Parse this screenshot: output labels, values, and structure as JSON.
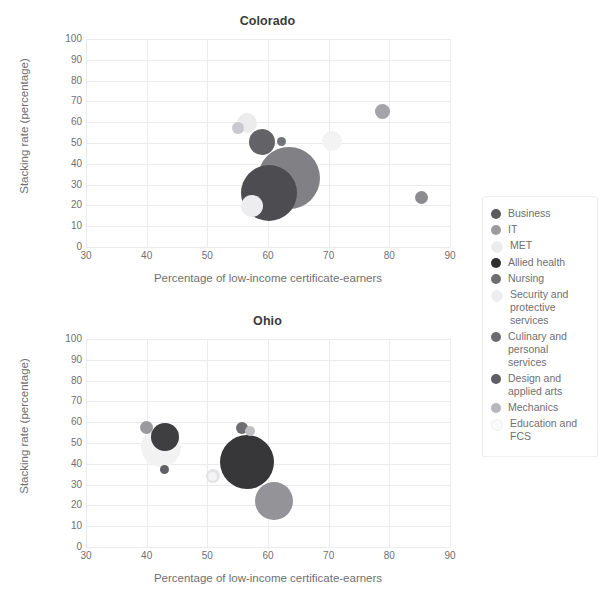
{
  "chart_data": [
    {
      "type": "scatter",
      "title": "Colorado",
      "xlabel": "Percentage of low-income certificate-earners",
      "ylabel": "Stacking rate (percentage)",
      "xlim": [
        30,
        90
      ],
      "ylim": [
        0,
        100
      ],
      "xticks": [
        30,
        40,
        50,
        60,
        70,
        80,
        90
      ],
      "yticks": [
        0,
        10,
        20,
        30,
        40,
        50,
        60,
        70,
        80,
        90,
        100
      ],
      "grid": true,
      "legend_position": "right",
      "points": [
        {
          "series": "Business",
          "x": 63.5,
          "y": 33.0,
          "size": 62,
          "color": "#808085"
        },
        {
          "series": "IT",
          "x": 85.3,
          "y": 24.0,
          "size": 13,
          "color": "#8b8b90"
        },
        {
          "series": "MET",
          "x": 56.5,
          "y": 59.5,
          "size": 20,
          "color": "#ececed"
        },
        {
          "series": "Allied health",
          "x": 60.2,
          "y": 26.0,
          "size": 56,
          "color": "#4d4d51"
        },
        {
          "series": "Nursing",
          "x": 59.0,
          "y": 50.5,
          "size": 26,
          "color": "#636367"
        },
        {
          "series": "Security and protective services",
          "x": 70.5,
          "y": 51.0,
          "size": 20,
          "color": "#f3f3f4"
        },
        {
          "series": "Culinary and personal services",
          "x": 78.8,
          "y": 65.0,
          "size": 15,
          "color": "#a4a4a8"
        },
        {
          "series": "Design and applied arts",
          "x": 62.3,
          "y": 50.5,
          "size": 9,
          "color": "#72727a"
        },
        {
          "series": "Mechanics",
          "x": 55.0,
          "y": 57.0,
          "size": 12,
          "color": "#c9c9cd"
        },
        {
          "series": "Education and FCS",
          "x": 57.3,
          "y": 19.5,
          "size": 22,
          "color": "#ededef"
        }
      ]
    },
    {
      "type": "scatter",
      "title": "Ohio",
      "xlabel": "Percentage of low-income certificate-earners",
      "ylabel": "Stacking rate (percentage)",
      "xlim": [
        30,
        90
      ],
      "ylim": [
        0,
        100
      ],
      "xticks": [
        30,
        40,
        50,
        60,
        70,
        80,
        90
      ],
      "yticks": [
        0,
        10,
        20,
        30,
        40,
        50,
        60,
        70,
        80,
        90,
        100
      ],
      "grid": true,
      "legend_position": "right",
      "points": [
        {
          "series": "Business",
          "x": 56.5,
          "y": 41.0,
          "size": 54,
          "color": "#373739"
        },
        {
          "series": "IT",
          "x": 61.0,
          "y": 22.0,
          "size": 38,
          "color": "#939398"
        },
        {
          "series": "MET",
          "x": 42.3,
          "y": 48.0,
          "size": 40,
          "color": "#f2f2f3"
        },
        {
          "series": "Allied health",
          "x": 43.0,
          "y": 53.0,
          "size": 28,
          "color": "#3f3f42"
        },
        {
          "series": "Nursing",
          "x": 55.7,
          "y": 57.0,
          "size": 12,
          "color": "#6d6d72"
        },
        {
          "series": "Security and protective services",
          "x": 51.0,
          "y": 34.0,
          "size": 14,
          "color": "#e4e4e6"
        },
        {
          "series": "Culinary and personal services",
          "x": 43.0,
          "y": 37.5,
          "size": 9,
          "color": "#616165"
        },
        {
          "series": "Design and applied arts",
          "x": 40.0,
          "y": 57.5,
          "size": 13,
          "color": "#9a9a9e"
        },
        {
          "series": "Mechanics",
          "x": 57.0,
          "y": 56.0,
          "size": 10,
          "color": "#c0c0c4"
        },
        {
          "series": "Education and FCS",
          "x": 50.8,
          "y": 33.8,
          "size": 9,
          "color": "#f4f4f5"
        }
      ]
    }
  ],
  "legend": {
    "items": [
      {
        "label": "Business",
        "color": "#5b5b60"
      },
      {
        "label": "IT",
        "color": "#9a9a9f"
      },
      {
        "label": "MET",
        "color": "#ececee"
      },
      {
        "label": "Allied health",
        "color": "#2f2f32"
      },
      {
        "label": "Nursing",
        "color": "#6d6d72"
      },
      {
        "label": "Security and protective services",
        "color": "#ededef"
      },
      {
        "label": "Culinary and personal services",
        "color": "#6b6b70"
      },
      {
        "label": "Design and applied arts",
        "color": "#5e5e64"
      },
      {
        "label": "Mechanics",
        "color": "#b7b7bb"
      },
      {
        "label": "Education and FCS",
        "color": "#fafafb"
      }
    ]
  }
}
